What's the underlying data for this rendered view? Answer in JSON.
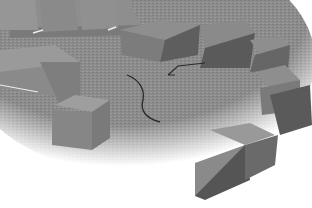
{
  "scene": {
    "description": "Grayscale 3D render of rectangular blocks arranged around the edge of a textured circular floor, with a curved dark path drawn on the floor",
    "colors": {
      "background": "#ffffff",
      "floor": "#8a8a8a",
      "block_top": "#9a9a9a",
      "block_side_light": "#8c8c8c",
      "block_side_dark": "#5e5e5e",
      "path_line": "#2a2a2a",
      "highlight": "#e8e8e8"
    },
    "objects": [
      {
        "type": "floor-disk"
      },
      {
        "type": "block",
        "name": "top-left-row"
      },
      {
        "type": "block",
        "name": "left-large"
      },
      {
        "type": "block",
        "name": "center-left-small"
      },
      {
        "type": "block",
        "name": "top-right-row"
      },
      {
        "type": "block",
        "name": "right-column"
      },
      {
        "type": "block",
        "name": "bottom-right-front"
      },
      {
        "type": "curve",
        "name": "floor-path"
      }
    ]
  }
}
